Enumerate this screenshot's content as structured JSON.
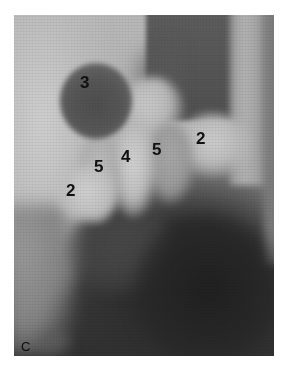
{
  "figure": {
    "panel_label": "C",
    "labels": [
      {
        "id": "label-3",
        "text": "3"
      },
      {
        "id": "label-2-right",
        "text": "2"
      },
      {
        "id": "label-5-right",
        "text": "5"
      },
      {
        "id": "label-4",
        "text": "4"
      },
      {
        "id": "label-5-left",
        "text": "5"
      },
      {
        "id": "label-2-left",
        "text": "2"
      }
    ],
    "colors": {
      "background": "#ffffff",
      "label_text": "#111111",
      "photo_light": "#c8c8c8",
      "photo_dark": "#262626"
    }
  }
}
